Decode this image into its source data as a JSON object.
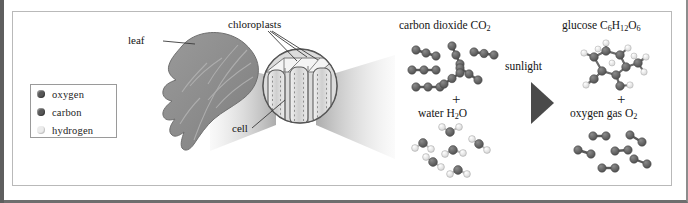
{
  "diagram": {
    "labels": {
      "leaf": "leaf",
      "chloroplasts": "chloroplasts",
      "cell": "cell",
      "sunlight": "sunlight",
      "plus_left": "+",
      "plus_right": "+"
    },
    "reactants": [
      {
        "name": "carbon dioxide",
        "formula_text": "CO2",
        "formula_main": "carbon dioxide CO",
        "formula_sub": "2",
        "molecule_count": 6,
        "molecule_type": "linear-3-atom"
      },
      {
        "name": "water",
        "formula_text": "H2O",
        "formula_main": "water H",
        "formula_sub": "2",
        "formula_tail": "O",
        "molecule_count": 6,
        "molecule_type": "bent-3-atom"
      }
    ],
    "products": [
      {
        "name": "glucose",
        "formula_text": "C6H12O6",
        "molecule_count": 1,
        "molecule_type": "glucose-ring"
      },
      {
        "name": "oxygen gas",
        "formula_text": "O2",
        "formula_main": "oxygen gas O",
        "formula_sub": "2",
        "molecule_count": 6,
        "molecule_type": "diatomic"
      }
    ],
    "legend": {
      "items": [
        {
          "label": "oxygen",
          "color": "#585858"
        },
        {
          "label": "carbon",
          "color": "#585858"
        },
        {
          "label": "hydrogen",
          "color": "#e2e2e2"
        }
      ]
    },
    "formula_parts": {
      "co2_main": "carbon dioxide CO",
      "co2_sub": "2",
      "water_main": "water H",
      "water_sub": "2",
      "water_tail": "O",
      "glucose_main": "glucose C",
      "glucose_sub1": "6",
      "glucose_h": "H",
      "glucose_sub2": "12",
      "glucose_o": "O",
      "glucose_sub3": "6",
      "o2_main": "oxygen gas O",
      "o2_sub": "2"
    },
    "colors": {
      "frame": "#6e6e6e",
      "panel_border": "#b9b9b9",
      "leaf_fill": "#8d8d8d",
      "atom_dark": "#585858",
      "atom_light": "#e8e8e8",
      "beam": "#c9c9c9",
      "arrow": "#4a4a4a"
    }
  }
}
